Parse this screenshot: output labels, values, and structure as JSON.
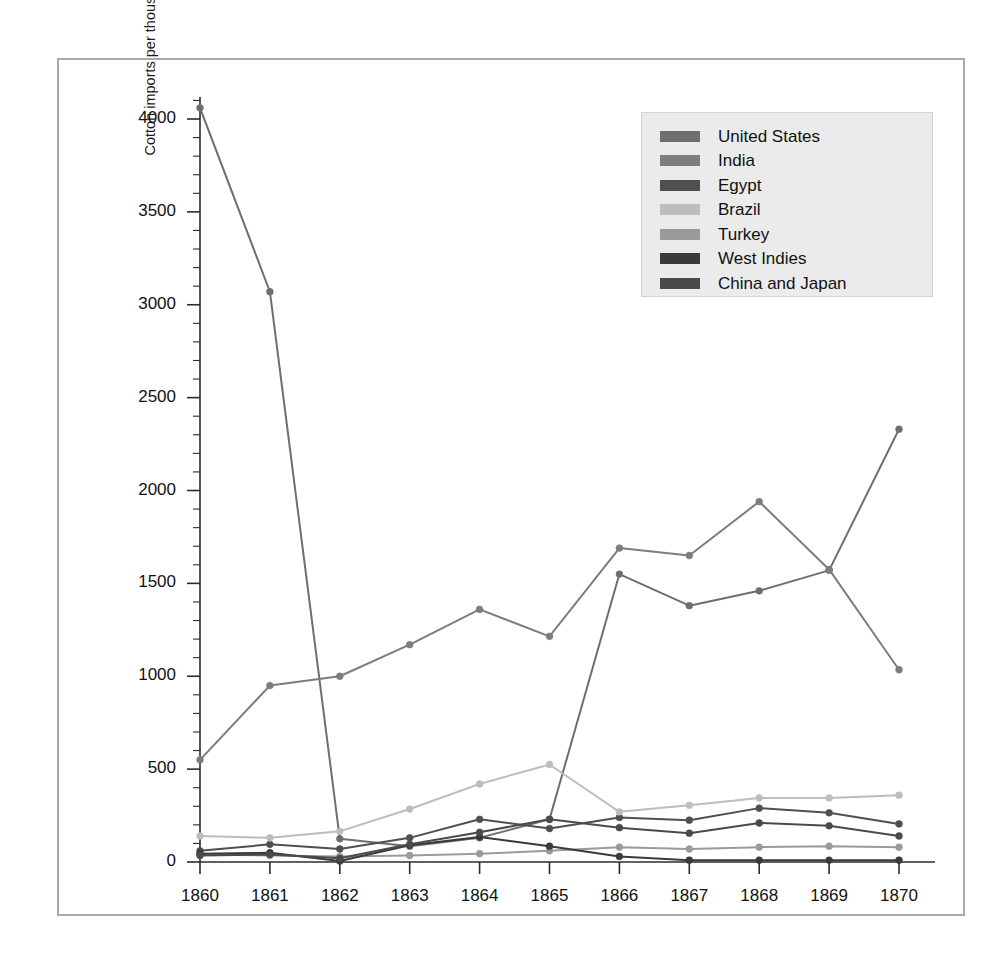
{
  "chart_data": {
    "type": "line",
    "title": "",
    "xlabel": "",
    "ylabel": "Cotton imports per thousand 400-pound bales",
    "x": [
      1860,
      1861,
      1862,
      1863,
      1864,
      1865,
      1866,
      1867,
      1868,
      1869,
      1870
    ],
    "categories": [
      "1860",
      "1861",
      "1862",
      "1863",
      "1864",
      "1865",
      "1866",
      "1867",
      "1868",
      "1869",
      "1870"
    ],
    "xlim": [
      1860,
      1870
    ],
    "ylim": [
      0,
      4250
    ],
    "yticks": [
      0,
      500,
      1000,
      1500,
      2000,
      2500,
      3000,
      3500,
      4000
    ],
    "ytick_labels": [
      "0",
      "500",
      "1000",
      "1500",
      "2000",
      "2500",
      "3000",
      "3500",
      "4000"
    ],
    "minor_tick_step": 100,
    "grid": false,
    "legend_position": "upper right",
    "markers": true,
    "series": [
      {
        "name": "United States",
        "color": "#6e6e6e",
        "values": [
          4060,
          3070,
          125,
          85,
          130,
          230,
          1550,
          1380,
          1460,
          1570,
          2330
        ]
      },
      {
        "name": "India",
        "color": "#7d7d7d",
        "values": [
          550,
          950,
          1000,
          1170,
          1360,
          1215,
          1690,
          1650,
          1940,
          1575,
          1035
        ]
      },
      {
        "name": "Egypt",
        "color": "#4f4f4f",
        "values": [
          60,
          95,
          70,
          130,
          230,
          180,
          240,
          225,
          290,
          265,
          205
        ]
      },
      {
        "name": "Brazil",
        "color": "#bdbdbd",
        "values": [
          140,
          130,
          165,
          285,
          420,
          525,
          270,
          305,
          345,
          345,
          360
        ]
      },
      {
        "name": "Turkey",
        "color": "#9a9a9a",
        "values": [
          40,
          35,
          30,
          35,
          45,
          60,
          80,
          70,
          80,
          85,
          80
        ]
      },
      {
        "name": "West Indies",
        "color": "#3a3a3a",
        "values": [
          45,
          50,
          5,
          90,
          135,
          85,
          30,
          10,
          10,
          10,
          10
        ]
      },
      {
        "name": "China and Japan",
        "color": "#4a4a4a",
        "values": [
          35,
          40,
          20,
          95,
          160,
          230,
          185,
          155,
          210,
          195,
          140
        ]
      }
    ]
  },
  "legend": {
    "items": [
      {
        "label": "United States",
        "color": "#6e6e6e"
      },
      {
        "label": "India",
        "color": "#7d7d7d"
      },
      {
        "label": "Egypt",
        "color": "#4f4f4f"
      },
      {
        "label": "Brazil",
        "color": "#bdbdbd"
      },
      {
        "label": "Turkey",
        "color": "#9a9a9a"
      },
      {
        "label": "West Indies",
        "color": "#3a3a3a"
      },
      {
        "label": "China and Japan",
        "color": "#4a4a4a"
      }
    ]
  }
}
